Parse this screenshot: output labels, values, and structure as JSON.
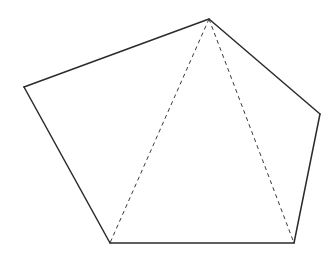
{
  "diagram": {
    "type": "pentagon-with-diagonals",
    "canvas": {
      "width": 336,
      "height": 264,
      "background": "#ffffff"
    },
    "colors": {
      "edge": "#2b2b2b",
      "diagonal": "#3a3a3a"
    },
    "vertices": [
      {
        "id": "top",
        "x": 209,
        "y": 19
      },
      {
        "id": "right",
        "x": 320,
        "y": 114
      },
      {
        "id": "bottom-right",
        "x": 294,
        "y": 243
      },
      {
        "id": "bottom-left",
        "x": 110,
        "y": 243
      },
      {
        "id": "left",
        "x": 24,
        "y": 87
      }
    ],
    "edges": [
      {
        "from": "top",
        "to": "right",
        "style": "solid"
      },
      {
        "from": "right",
        "to": "bottom-right",
        "style": "solid"
      },
      {
        "from": "bottom-right",
        "to": "bottom-left",
        "style": "solid"
      },
      {
        "from": "bottom-left",
        "to": "left",
        "style": "solid"
      },
      {
        "from": "left",
        "to": "top",
        "style": "solid"
      }
    ],
    "diagonals": [
      {
        "from": "top",
        "to": "bottom-left",
        "style": "dashed"
      },
      {
        "from": "top",
        "to": "bottom-right",
        "style": "dashed"
      }
    ]
  }
}
